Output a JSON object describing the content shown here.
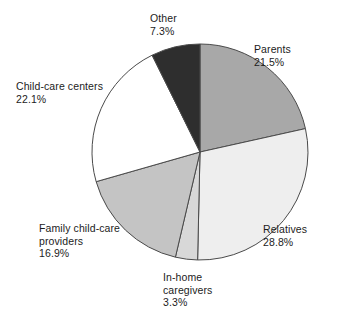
{
  "chart_data": {
    "type": "pie",
    "title": "",
    "subtitle": "",
    "xlabel": "",
    "ylabel": "",
    "legend_position": "none",
    "grid": false,
    "labels_outside": true,
    "start_angle_deg": 0,
    "direction": "clockwise",
    "total_percent": "99.9",
    "categories": [
      "Parents",
      "Relatives",
      "In-home caregivers",
      "Family child-care providers",
      "Child-care centers",
      "Other"
    ],
    "values": [
      21.5,
      28.8,
      3.3,
      16.9,
      22.1,
      7.3
    ],
    "value_labels": [
      "21.5%",
      "28.8%",
      "3.3%",
      "16.9%",
      "22.1%",
      "7.3%"
    ],
    "colors": [
      "#a8a8a8",
      "#eeeeee",
      "#d8d8d8",
      "#c4c4c4",
      "#ffffff",
      "#2e2e2e"
    ],
    "slice_outline_color": "#4a4a4a"
  },
  "slices": {
    "parents": {
      "name": "Parents",
      "percent_label": "21.5%",
      "value": 21.5,
      "color": "#a8a8a8"
    },
    "relatives": {
      "name": "Relatives",
      "percent_label": "28.8%",
      "value": 28.8,
      "color": "#eeeeee"
    },
    "inhome": {
      "name_line1": "In-home",
      "name_line2": "caregivers",
      "percent_label": "3.3%",
      "value": 3.3,
      "color": "#d8d8d8"
    },
    "family": {
      "name_line1": "Family child-care",
      "name_line2": "providers",
      "percent_label": "16.9%",
      "value": 16.9,
      "color": "#c4c4c4"
    },
    "centers": {
      "name": "Child-care centers",
      "percent_label": "22.1%",
      "value": 22.1,
      "color": "#ffffff"
    },
    "other": {
      "name": "Other",
      "percent_label": "7.3%",
      "value": 7.3,
      "color": "#2e2e2e"
    }
  }
}
